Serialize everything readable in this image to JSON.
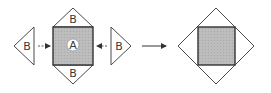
{
  "diagram": {
    "labels": {
      "square": "A",
      "triangle_top": "B",
      "triangle_bottom": "B",
      "triangle_left": "B",
      "triangle_right": "B"
    },
    "colors": {
      "stroke": "#4a4a4a",
      "fill_square": "#b8b8b8",
      "fill_circle": "#ffffff"
    }
  }
}
